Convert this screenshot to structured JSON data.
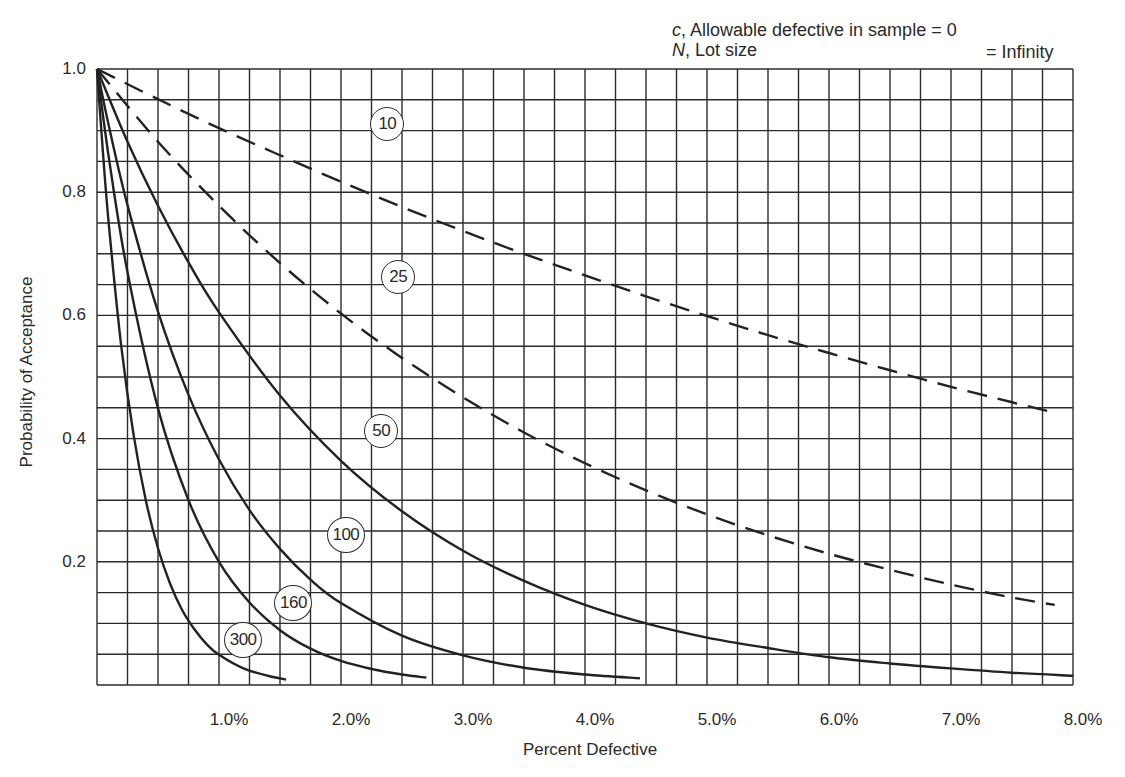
{
  "annotation": {
    "line1_var": "c",
    "line1_text": ", Allowable defective in sample = 0",
    "line2_var": "N",
    "line2_text": ", Lot size",
    "line2_value": "= Infinity"
  },
  "axes": {
    "ylabel": "Probability of Acceptance",
    "xlabel": "Percent Defective",
    "yticks": [
      {
        "value": 1.0,
        "label": "1.0"
      },
      {
        "value": 0.8,
        "label": "0.8"
      },
      {
        "value": 0.6,
        "label": "0.6"
      },
      {
        "value": 0.4,
        "label": "0.4"
      },
      {
        "value": 0.2,
        "label": "0.2"
      }
    ],
    "xticks": [
      {
        "value": 1,
        "label": "1.0%"
      },
      {
        "value": 2,
        "label": "2.0%"
      },
      {
        "value": 3,
        "label": "3.0%"
      },
      {
        "value": 4,
        "label": "4.0%"
      },
      {
        "value": 5,
        "label": "5.0%"
      },
      {
        "value": 6,
        "label": "6.0%"
      },
      {
        "value": 7,
        "label": "7.0%"
      },
      {
        "value": 8,
        "label": "8.0%"
      }
    ]
  },
  "colors": {
    "grid": "#2b2b2b",
    "curve": "#222222",
    "background": "#ffffff"
  },
  "chart_data": {
    "type": "line",
    "title": "",
    "annotation": "c, Allowable defective in sample = 0; N, Lot size = Infinity",
    "xlabel": "Percent Defective",
    "ylabel": "Probability of Acceptance",
    "xlim": [
      0,
      8
    ],
    "ylim": [
      0,
      1
    ],
    "grid": {
      "on": true,
      "x_step": 0.25,
      "y_step": 0.05
    },
    "legend": "inline circled sample-size labels on each curve",
    "series": [
      {
        "name": "10",
        "style": "dashed",
        "label_pos": [
          2.38,
          0.91
        ],
        "x": [
          0,
          0.5,
          1,
          1.5,
          2,
          2.5,
          3,
          3.5,
          4,
          4.5,
          5,
          5.5,
          6,
          6.5,
          7,
          7.5,
          7.85
        ],
        "y": [
          1.0,
          0.951,
          0.904,
          0.86,
          0.817,
          0.776,
          0.737,
          0.7,
          0.665,
          0.631,
          0.599,
          0.568,
          0.539,
          0.511,
          0.484,
          0.459,
          0.442
        ]
      },
      {
        "name": "25",
        "style": "dashed",
        "label_pos": [
          2.47,
          0.662
        ],
        "x": [
          0,
          0.5,
          1,
          1.5,
          2,
          2.5,
          3,
          3.5,
          4,
          4.5,
          5,
          5.5,
          6,
          6.5,
          7,
          7.5,
          7.85
        ],
        "y": [
          1.0,
          0.882,
          0.778,
          0.685,
          0.603,
          0.531,
          0.467,
          0.41,
          0.36,
          0.316,
          0.277,
          0.243,
          0.213,
          0.187,
          0.163,
          0.142,
          0.13
        ]
      },
      {
        "name": "50",
        "style": "solid",
        "label_pos": [
          2.33,
          0.412
        ],
        "x": [
          0,
          0.25,
          0.5,
          0.75,
          1,
          1.5,
          2,
          2.5,
          3,
          3.5,
          4,
          4.5,
          5,
          5.5,
          6,
          6.5,
          7,
          7.5,
          8
        ],
        "y": [
          1.0,
          0.882,
          0.778,
          0.686,
          0.605,
          0.47,
          0.364,
          0.282,
          0.218,
          0.169,
          0.13,
          0.1,
          0.077,
          0.06,
          0.045,
          0.035,
          0.027,
          0.02,
          0.015
        ]
      },
      {
        "name": "100",
        "style": "solid",
        "label_pos": [
          2.04,
          0.243
        ],
        "x": [
          0,
          0.1,
          0.25,
          0.5,
          0.75,
          1,
          1.25,
          1.5,
          1.75,
          2,
          2.5,
          3,
          3.5,
          4,
          4.45
        ],
        "y": [
          1.0,
          0.905,
          0.779,
          0.606,
          0.471,
          0.366,
          0.284,
          0.221,
          0.171,
          0.133,
          0.08,
          0.048,
          0.028,
          0.017,
          0.011
        ]
      },
      {
        "name": "160",
        "style": "solid",
        "label_pos": [
          1.61,
          0.133
        ],
        "x": [
          0,
          0.1,
          0.25,
          0.5,
          0.75,
          1,
          1.25,
          1.5,
          1.75,
          2,
          2.25,
          2.5,
          2.7
        ],
        "y": [
          1.0,
          0.852,
          0.67,
          0.449,
          0.3,
          0.2,
          0.134,
          0.089,
          0.059,
          0.039,
          0.026,
          0.017,
          0.012
        ]
      },
      {
        "name": "300",
        "style": "solid",
        "label_pos": [
          1.198,
          0.073
        ],
        "x": [
          0,
          0.05,
          0.1,
          0.2,
          0.3,
          0.4,
          0.5,
          0.6,
          0.7,
          0.8,
          0.9,
          1.0,
          1.2,
          1.4,
          1.55
        ],
        "y": [
          1.0,
          0.861,
          0.741,
          0.548,
          0.406,
          0.3,
          0.222,
          0.164,
          0.121,
          0.09,
          0.066,
          0.049,
          0.027,
          0.015,
          0.009
        ]
      }
    ]
  }
}
